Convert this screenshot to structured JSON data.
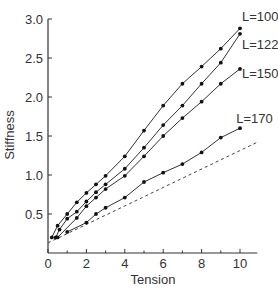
{
  "chart_data": {
    "type": "line",
    "title": "",
    "xlabel": "Tension",
    "ylabel": "Stiffness",
    "xlim": [
      0,
      10.9
    ],
    "ylim": [
      0,
      3.0
    ],
    "xticks": [
      0,
      2,
      4,
      6,
      8,
      10
    ],
    "xticks_minor": [
      1,
      3,
      5,
      7,
      9
    ],
    "yticks": [
      0.5,
      1.0,
      1.5,
      2.0,
      2.5,
      3.0
    ],
    "ytick_labels": [
      "0.5",
      "1.0",
      "1.5",
      "2.0",
      "2.5",
      "3.0"
    ],
    "grid": false,
    "legend": "inline labels at line ends",
    "series": [
      {
        "name": "L=100",
        "label_pos": [
          10.1,
          2.97
        ],
        "x": [
          0.2,
          0.5,
          1,
          1.5,
          2,
          2.5,
          3,
          4,
          5,
          6,
          7,
          8,
          9,
          10
        ],
        "values": [
          0.2,
          0.35,
          0.5,
          0.65,
          0.77,
          0.88,
          0.99,
          1.24,
          1.57,
          1.89,
          2.17,
          2.39,
          2.62,
          2.88
        ]
      },
      {
        "name": "L=122",
        "label_pos": [
          10.1,
          2.62
        ],
        "x": [
          0.4,
          0.6,
          1,
          1.5,
          2,
          2.5,
          3,
          4,
          5,
          6,
          7,
          8,
          9,
          10
        ],
        "values": [
          0.2,
          0.3,
          0.44,
          0.53,
          0.66,
          0.78,
          0.88,
          1.08,
          1.35,
          1.64,
          1.89,
          2.17,
          2.44,
          2.81
        ]
      },
      {
        "name": "L=150",
        "label_pos": [
          10.1,
          2.24
        ],
        "x": [
          0.5,
          1.5,
          2,
          2.5,
          3,
          4,
          5,
          6,
          7,
          8,
          9,
          10
        ],
        "values": [
          0.2,
          0.45,
          0.6,
          0.71,
          0.82,
          0.99,
          1.24,
          1.5,
          1.73,
          1.94,
          2.17,
          2.36
        ]
      },
      {
        "name": "L=170",
        "label_pos": [
          9.8,
          1.67
        ],
        "x": [
          1,
          2,
          2.5,
          3,
          4,
          5,
          6,
          7,
          8,
          9,
          10
        ],
        "values": [
          0.27,
          0.39,
          0.5,
          0.58,
          0.71,
          0.91,
          1.03,
          1.14,
          1.29,
          1.48,
          1.6
        ]
      }
    ],
    "reference_line": {
      "style": "dashed",
      "x": [
        0,
        10.9
      ],
      "values": [
        0.13,
        1.42
      ]
    }
  }
}
